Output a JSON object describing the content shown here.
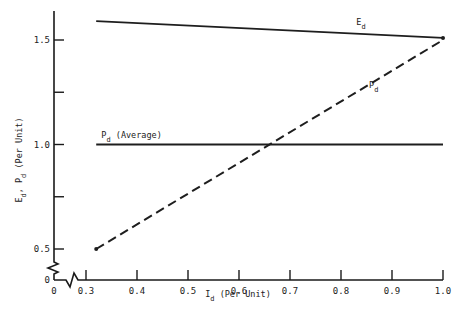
{
  "chart_data": {
    "type": "line",
    "title": "",
    "xlabel": {
      "main": "I",
      "sub": "d",
      "rest": " (Per Unit)"
    },
    "ylabel": {
      "text": "E_d, P_d (Per Unit)",
      "parts": [
        "E",
        "d",
        ", P",
        "d",
        " (Per Unit)"
      ]
    },
    "xlim": [
      0.3,
      1.0
    ],
    "ylim": [
      0.5,
      1.6
    ],
    "axis_break": true,
    "x_ticks": [
      0.3,
      0.4,
      0.5,
      0.6,
      0.7,
      0.8,
      0.9,
      1.0
    ],
    "x_tick_labels": [
      "0.3",
      "0.4",
      "0.5",
      "0.6",
      "0.7",
      "0.8",
      "0.9",
      "1.0"
    ],
    "x_origin_label": "0",
    "y_ticks": [
      0.5,
      0.75,
      1.0,
      1.25,
      1.5
    ],
    "y_tick_labels": [
      "0.5",
      "",
      "1.0",
      "",
      "1.5"
    ],
    "y_origin_label": "0",
    "grid": false,
    "series": [
      {
        "name": "E_d",
        "label_main": "E",
        "label_sub": "d",
        "style": "solid",
        "x": [
          0.32,
          1.0
        ],
        "y": [
          1.59,
          1.51
        ],
        "end_marker": true,
        "label_at": [
          0.83,
          1.57
        ]
      },
      {
        "name": "P_d",
        "label_main": "P",
        "label_sub": "d",
        "style": "dashed",
        "x": [
          0.32,
          1.0
        ],
        "y": [
          0.5,
          1.5
        ],
        "start_marker": true,
        "label_at": [
          0.855,
          1.27
        ]
      },
      {
        "name": "P_d (Average)",
        "label_main": "P",
        "label_sub": "d",
        "label_rest": " (Average)",
        "style": "solid",
        "x": [
          0.32,
          1.0
        ],
        "y": [
          1.0,
          1.0
        ],
        "label_at": [
          0.33,
          1.03
        ]
      }
    ]
  }
}
